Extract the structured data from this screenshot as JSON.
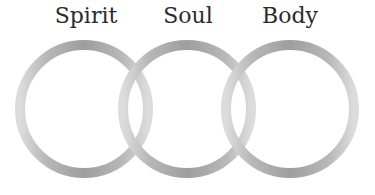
{
  "diagram": {
    "type": "venn-rings",
    "labels": [
      {
        "id": "spirit",
        "text": "Spirit",
        "x": 86
      },
      {
        "id": "soul",
        "text": "Soul",
        "x": 188
      },
      {
        "id": "body",
        "text": "Body",
        "x": 290
      }
    ],
    "rings": [
      {
        "id": "spirit",
        "cx": 84,
        "cy": 109,
        "r": 64
      },
      {
        "id": "soul",
        "cx": 187,
        "cy": 109,
        "r": 64
      },
      {
        "id": "body",
        "cx": 290,
        "cy": 109,
        "r": 64
      }
    ],
    "stroke_width": 10,
    "colors": {
      "ring_dark": "#9a9a9a",
      "ring_light": "#dcdcdc",
      "text": "#2b2b2b",
      "background": "#ffffff"
    }
  }
}
